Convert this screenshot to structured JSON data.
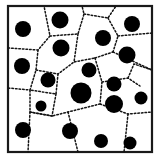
{
  "figure": {
    "title": "Voronoi tessellation with dispersed particles",
    "colors": {
      "background": "#ffffff",
      "frame_stroke": "#1a1a1a",
      "cell_edge": "#141414",
      "particle_fill": "#000000"
    }
  },
  "chart_data": {
    "type": "scatter",
    "title": "Voronoi tessellation with dispersed particles",
    "subtitle": "",
    "xlabel": "",
    "ylabel": "",
    "xlim": [
      8,
      152
    ],
    "ylim": [
      6,
      152
    ],
    "grid": false,
    "legend": null,
    "tick_labels": {
      "x": [],
      "y": []
    },
    "annotations": [],
    "frame": {
      "x": 8,
      "y": 6,
      "width": 144,
      "height": 146,
      "stroke_width": 2.2
    },
    "particle_count": 21,
    "particles": [
      {
        "id": "p1",
        "x": 23,
        "y": 29,
        "r": 8.0
      },
      {
        "id": "p2",
        "x": 60,
        "y": 20,
        "r": 8.5
      },
      {
        "id": "p3",
        "x": 132,
        "y": 24,
        "r": 8.0
      },
      {
        "id": "p4",
        "x": 103,
        "y": 38,
        "r": 8.0
      },
      {
        "id": "p5",
        "x": 61,
        "y": 48,
        "r": 8.5
      },
      {
        "id": "p6",
        "x": 22,
        "y": 66,
        "r": 8.0
      },
      {
        "id": "p7",
        "x": 127,
        "y": 55,
        "r": 8.5
      },
      {
        "id": "p8",
        "x": 89,
        "y": 70,
        "r": 7.5
      },
      {
        "id": "p9",
        "x": 48,
        "y": 80,
        "r": 7.5
      },
      {
        "id": "p10",
        "x": 114,
        "y": 84,
        "r": 7.5
      },
      {
        "id": "p11",
        "x": 81,
        "y": 93,
        "r": 10.5
      },
      {
        "id": "p12",
        "x": 114,
        "y": 104,
        "r": 9.0
      },
      {
        "id": "p13",
        "x": 141,
        "y": 98,
        "r": 6.5
      },
      {
        "id": "p14",
        "x": 41,
        "y": 106,
        "r": 5.5
      },
      {
        "id": "p15",
        "x": 23,
        "y": 130,
        "r": 8.0
      },
      {
        "id": "p16",
        "x": 70,
        "y": 131,
        "r": 8.0
      },
      {
        "id": "p17",
        "x": 101,
        "y": 141,
        "r": 7.0
      },
      {
        "id": "p18",
        "x": 130,
        "y": 143,
        "r": 6.5
      }
    ],
    "cell_edges": [
      {
        "id": "e1",
        "points": "8,48 38,50 50,36 44,6"
      },
      {
        "id": "e2",
        "points": "50,36 78,34 84,14 82,6"
      },
      {
        "id": "e3",
        "points": "78,34 74,62 95,58"
      },
      {
        "id": "e4",
        "points": "84,14 108,18 116,6"
      },
      {
        "id": "e5",
        "points": "108,18 118,36 113,52"
      },
      {
        "id": "e6",
        "points": "118,36 152,33"
      },
      {
        "id": "e7",
        "points": "113,52 152,70"
      },
      {
        "id": "e8",
        "points": "95,58 113,52"
      },
      {
        "id": "e9",
        "points": "38,50 36,70 30,90 8,88"
      },
      {
        "id": "e10",
        "points": "36,70 58,74 74,62"
      },
      {
        "id": "e11",
        "points": "58,74 56,94 30,90"
      },
      {
        "id": "e12",
        "points": "56,94 52,116 30,112 30,90"
      },
      {
        "id": "e13",
        "points": "52,116 30,112"
      },
      {
        "id": "e14",
        "points": "30,112 28,152"
      },
      {
        "id": "e15",
        "points": "95,58 102,82 100,104 68,112 52,116"
      },
      {
        "id": "e16",
        "points": "102,82 128,78 140,86"
      },
      {
        "id": "e17",
        "points": "128,78 134,64 152,70"
      },
      {
        "id": "e18",
        "points": "100,104 128,114 152,112"
      },
      {
        "id": "e19",
        "points": "128,114 124,152"
      },
      {
        "id": "e20",
        "points": "68,112 78,152"
      }
    ]
  }
}
